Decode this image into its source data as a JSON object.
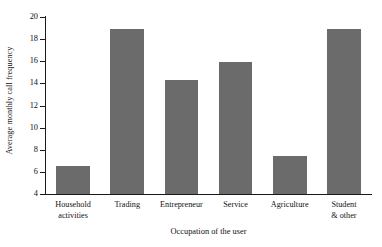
{
  "chart_data": {
    "type": "bar",
    "title": "",
    "xlabel": "Occupation of the user",
    "ylabel": "Average monthly call frequency",
    "categories": [
      "Household activities",
      "Trading",
      "Entrepreneur",
      "Service",
      "Agriculture",
      "Student & other"
    ],
    "category_lines": [
      [
        "Household",
        "activities"
      ],
      [
        "Trading",
        ""
      ],
      [
        "Entrepreneur",
        ""
      ],
      [
        "Service",
        ""
      ],
      [
        "Agriculture",
        ""
      ],
      [
        "Student",
        "& other"
      ]
    ],
    "values": [
      6.5,
      18.9,
      14.3,
      15.9,
      7.4,
      18.9
    ],
    "ylim": [
      4,
      20
    ],
    "yticks": [
      4,
      6,
      8,
      10,
      12,
      14,
      16,
      18,
      20
    ],
    "ytick_labels": [
      "4",
      "6",
      "8",
      "10",
      "12",
      "14",
      "16",
      "18",
      "20"
    ],
    "grid": false,
    "legend": null,
    "bar_color": "#6b6b6b",
    "axis_color": "#1a1a1a",
    "background": "#ffffff"
  }
}
